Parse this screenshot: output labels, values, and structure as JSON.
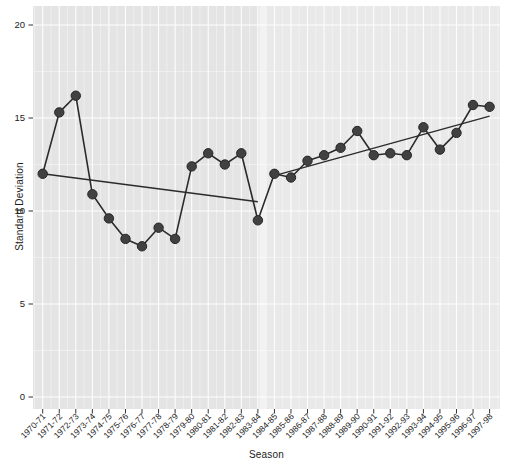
{
  "chart_data": {
    "type": "line",
    "title": "",
    "xlabel": "Season",
    "ylabel": "Standard Deviation",
    "ylim": [
      0,
      20
    ],
    "yticks": [
      0,
      5,
      10,
      15,
      20
    ],
    "grid": "on",
    "legend": "none",
    "categories": [
      "1970-71",
      "1971-72",
      "1972-73",
      "1973-74",
      "1974-75",
      "1975-76",
      "1976-77",
      "1977-78",
      "1978-79",
      "1979-80",
      "1980-81",
      "1981-82",
      "1982-83",
      "1983-84",
      "1984-85",
      "1985-86",
      "1986-87",
      "1987-88",
      "1988-89",
      "1989-90",
      "1990-91",
      "1991-92",
      "1992-93",
      "1993-94",
      "1994-95",
      "1995-96",
      "1996-97",
      "1997-98"
    ],
    "series": [
      {
        "name": "standard-deviation-observed",
        "values": [
          12.0,
          15.3,
          16.2,
          10.9,
          9.6,
          8.5,
          8.1,
          9.1,
          8.5,
          12.4,
          13.1,
          12.5,
          13.1,
          9.5,
          12.0,
          11.8,
          12.7,
          13.0,
          13.4,
          14.3,
          13.0,
          13.1,
          13.0,
          14.5,
          13.3,
          14.2,
          15.7,
          15.6
        ]
      },
      {
        "name": "trend-1970-71-to-1983-84",
        "type": "trend-segment",
        "start_category": "1970-71",
        "end_category": "1983-84",
        "start_value": 12.0,
        "end_value": 10.5
      },
      {
        "name": "trend-1984-85-to-1997-98",
        "type": "trend-segment",
        "start_category": "1984-85",
        "end_category": "1997-98",
        "start_value": 11.9,
        "end_value": 15.1
      }
    ],
    "highlight_divider_between": [
      "1983-84",
      "1984-85"
    ],
    "colors": {
      "panel_left": "#e4e4e4",
      "panel_right": "#e9e9e9",
      "divider_band": "#f4f4f4",
      "grid_major": "#ffffff",
      "grid_minor": "#f0f0f0",
      "line": "#2b2b2b",
      "point_fill": "#414141",
      "point_stroke": "#262626",
      "tick": "#333333",
      "tick_label": "#1c1c1c"
    }
  }
}
